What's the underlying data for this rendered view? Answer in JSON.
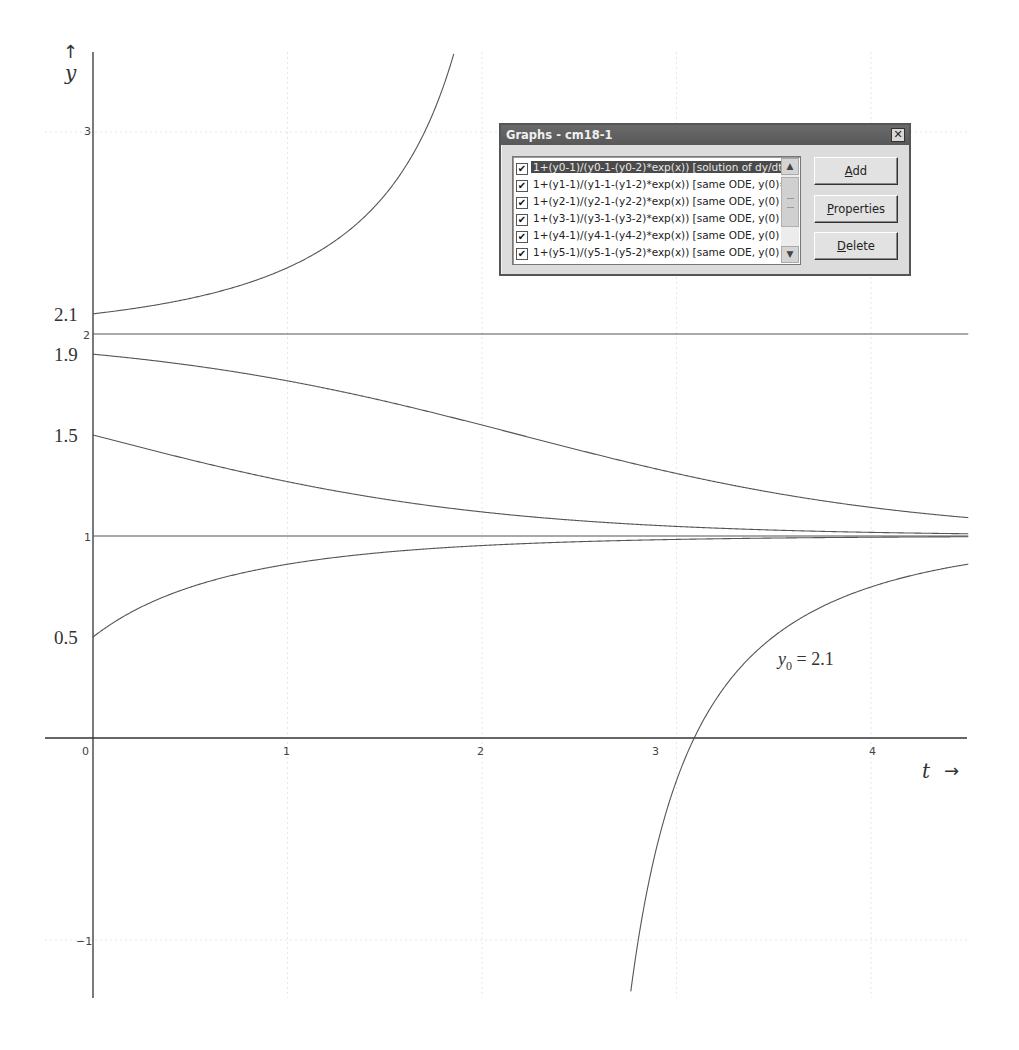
{
  "chart_data": {
    "type": "line",
    "title": "",
    "xlabel": "t",
    "ylabel": "y",
    "xlim": [
      -0.25,
      4.5
    ],
    "ylim": [
      -1.29,
      3.39
    ],
    "grid": true,
    "x_ticks": [
      "0",
      "1",
      "2",
      "3",
      "4"
    ],
    "y_ticks": [
      "3",
      "2",
      "1",
      "-1"
    ],
    "initial_value_labels": [
      "2.1",
      "1.9",
      "1.5",
      "0.5"
    ],
    "formula": "y = 1 + (y0-1)/((y0-1) - (y0-2)*exp(t))",
    "series": [
      {
        "name": "y0 = 2.1",
        "y0": 2.1,
        "t_range": [
          0,
          4.5
        ]
      },
      {
        "name": "y0 = 2",
        "y0": 2.0,
        "t_range": [
          0,
          4.5
        ]
      },
      {
        "name": "y0 = 1.9",
        "y0": 1.9,
        "t_range": [
          0,
          4.5
        ]
      },
      {
        "name": "y0 = 1.5",
        "y0": 1.5,
        "t_range": [
          0,
          4.5
        ]
      },
      {
        "name": "y0 = 1",
        "y0": 1.0,
        "t_range": [
          0,
          4.5
        ]
      },
      {
        "name": "y0 = 0.5",
        "y0": 0.5,
        "t_range": [
          0,
          4.5
        ]
      }
    ],
    "sample_points": {
      "y0 = 2.1": [
        [
          0,
          2.1
        ],
        [
          1,
          2.57
        ],
        [
          1.5,
          3.27
        ],
        [
          1.86,
          3.39
        ],
        [
          2.76,
          -1.29
        ],
        [
          3.0,
          -0.23
        ],
        [
          3.5,
          0.42
        ],
        [
          4.0,
          0.67
        ],
        [
          4.5,
          0.82
        ]
      ],
      "y0 = 1.9": [
        [
          0,
          1.9
        ],
        [
          1,
          1.77
        ],
        [
          2,
          1.55
        ],
        [
          3,
          1.27
        ],
        [
          4,
          1.13
        ],
        [
          4.5,
          1.09
        ]
      ],
      "y0 = 1.5": [
        [
          0,
          1.5
        ],
        [
          1,
          1.27
        ],
        [
          2,
          1.12
        ],
        [
          3,
          1.05
        ],
        [
          4,
          1.02
        ],
        [
          4.5,
          1.01
        ]
      ],
      "y0 = 0.5": [
        [
          0,
          0.5
        ],
        [
          1,
          0.86
        ],
        [
          2,
          0.95
        ],
        [
          3,
          0.98
        ],
        [
          4,
          0.99
        ],
        [
          4.5,
          1.0
        ]
      ]
    },
    "annotations": [
      {
        "text": "y0 = 2.1",
        "t": 3.45,
        "y": 0.43
      }
    ]
  },
  "axes": {
    "y_arrow": "↑",
    "y_label": "y",
    "t_label": "t",
    "t_arrow": "→",
    "x_tick_labels": [
      "0",
      "1",
      "2",
      "3",
      "4"
    ],
    "y_tick_labels": [
      "3",
      "2",
      "1",
      "−1"
    ],
    "y0_labels": [
      "2.1",
      "1.9",
      "1.5",
      "0.5"
    ],
    "annotation_var": "y",
    "annotation_sub": "0",
    "annotation_rest": " = 2.1"
  },
  "dialog": {
    "title": "Graphs - cm18-1",
    "close_glyph": "✕",
    "check_glyph": "✔",
    "scroll_up_glyph": "▲",
    "scroll_down_glyph": "▼",
    "items": [
      {
        "checked": true,
        "selected": true,
        "label": "1+(y0-1)/(y0-1-(y0-2)*exp(x)) [solution of dy/dt ="
      },
      {
        "checked": true,
        "selected": false,
        "label": "1+(y1-1)/(y1-1-(y1-2)*exp(x)) [same ODE,  y(0)="
      },
      {
        "checked": true,
        "selected": false,
        "label": "1+(y2-1)/(y2-1-(y2-2)*exp(x)) [same ODE,   y(0) ="
      },
      {
        "checked": true,
        "selected": false,
        "label": "1+(y3-1)/(y3-1-(y3-2)*exp(x)) [same ODE,    y(0)"
      },
      {
        "checked": true,
        "selected": false,
        "label": "1+(y4-1)/(y4-1-(y4-2)*exp(x)) [same ODE,   y(0) ="
      },
      {
        "checked": true,
        "selected": false,
        "label": "1+(y5-1)/(y5-1-(y5-2)*exp(x)) [same ODE,    y(0)"
      }
    ],
    "buttons": {
      "add_mnemonic": "A",
      "add_rest": "dd",
      "properties_mnemonic": "P",
      "properties_rest": "roperties",
      "delete_mnemonic": "D",
      "delete_rest": "elete"
    }
  }
}
